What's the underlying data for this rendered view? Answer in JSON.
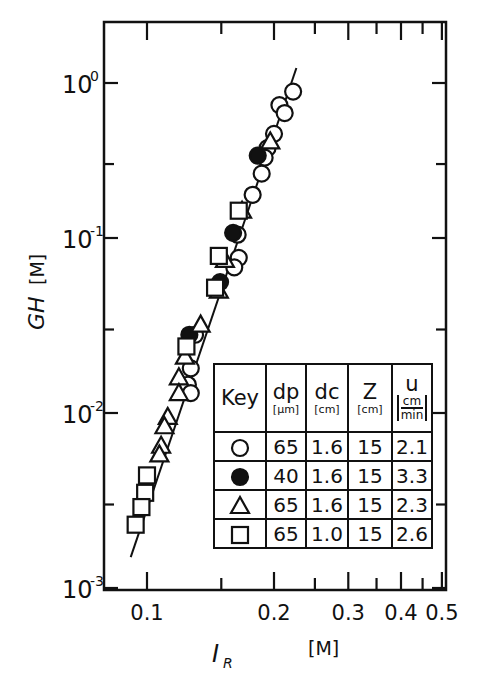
{
  "chart_data": {
    "type": "scatter",
    "title": "",
    "xlabel": "I_R",
    "xlabel_unit": "[M]",
    "ylabel": "GH",
    "ylabel_unit": "[M]",
    "xscale": "log",
    "yscale": "log",
    "xlim": [
      0.079,
      0.5
    ],
    "ylim": [
      0.001,
      1.6
    ],
    "grid": false,
    "x_ticks": [
      {
        "value": 0.1,
        "label": "0.1"
      },
      {
        "value": 0.15,
        "label": ""
      },
      {
        "value": 0.2,
        "label": "0.2"
      },
      {
        "value": 0.25,
        "label": ""
      },
      {
        "value": 0.3,
        "label": "0.3"
      },
      {
        "value": 0.35,
        "label": ""
      },
      {
        "value": 0.4,
        "label": "0.4"
      },
      {
        "value": 0.45,
        "label": ""
      },
      {
        "value": 0.5,
        "label": "0.5"
      }
    ],
    "y_ticks": [
      {
        "value": 1,
        "base": "10",
        "exp": "0"
      },
      {
        "value": 0.3,
        "base": "",
        "exp": ""
      },
      {
        "value": 0.1,
        "base": "10",
        "exp": "-1"
      },
      {
        "value": 0.03,
        "base": "",
        "exp": ""
      },
      {
        "value": 0.01,
        "base": "10",
        "exp": "-2"
      },
      {
        "value": 0.003,
        "base": "",
        "exp": ""
      },
      {
        "value": 0.001,
        "base": "10",
        "exp": "-3"
      }
    ],
    "fit_line": {
      "x": [
        0.0915,
        0.226
      ],
      "y": [
        0.0015,
        1.25
      ]
    },
    "series": [
      {
        "name": "open-circle",
        "marker": "circle",
        "filled": false,
        "dp_um": 65,
        "dc_cm": 1.6,
        "Z_cm": 15,
        "u_cm_min": 2.1,
        "points": [
          [
            0.222,
            0.88
          ],
          [
            0.206,
            0.72
          ],
          [
            0.212,
            0.64
          ],
          [
            0.2,
            0.47
          ],
          [
            0.193,
            0.38
          ],
          [
            0.19,
            0.33
          ],
          [
            0.187,
            0.26
          ],
          [
            0.178,
            0.19
          ],
          [
            0.164,
            0.105
          ],
          [
            0.165,
            0.077
          ],
          [
            0.161,
            0.068
          ],
          [
            0.13,
            0.028
          ],
          [
            0.127,
            0.018
          ],
          [
            0.125,
            0.0145
          ],
          [
            0.127,
            0.013
          ]
        ]
      },
      {
        "name": "filled-circle",
        "marker": "circle",
        "filled": true,
        "dp_um": 40,
        "dc_cm": 1.6,
        "Z_cm": 15,
        "u_cm_min": 3.3,
        "points": [
          [
            0.183,
            0.34
          ],
          [
            0.16,
            0.108
          ],
          [
            0.149,
            0.056
          ],
          [
            0.126,
            0.028
          ]
        ]
      },
      {
        "name": "triangle",
        "marker": "triangle",
        "filled": false,
        "dp_um": 65,
        "dc_cm": 1.6,
        "Z_cm": 15,
        "u_cm_min": 2.3,
        "points": [
          [
            0.196,
            0.42
          ],
          [
            0.168,
            0.15
          ],
          [
            0.153,
            0.075
          ],
          [
            0.148,
            0.05
          ],
          [
            0.134,
            0.032
          ],
          [
            0.123,
            0.021
          ],
          [
            0.119,
            0.016
          ],
          [
            0.119,
            0.013
          ],
          [
            0.112,
            0.0095
          ],
          [
            0.11,
            0.0084
          ],
          [
            0.108,
            0.0065
          ],
          [
            0.107,
            0.0058
          ]
        ]
      },
      {
        "name": "square",
        "marker": "square",
        "filled": false,
        "dp_um": 65,
        "dc_cm": 1.0,
        "Z_cm": 15,
        "u_cm_min": 2.6,
        "points": [
          [
            0.165,
            0.15
          ],
          [
            0.148,
            0.079
          ],
          [
            0.145,
            0.052
          ],
          [
            0.124,
            0.024
          ],
          [
            0.1,
            0.0044
          ],
          [
            0.099,
            0.0035
          ],
          [
            0.097,
            0.0029
          ],
          [
            0.094,
            0.0023
          ]
        ]
      }
    ]
  },
  "legend": {
    "headers": [
      {
        "main": "Key",
        "unit": ""
      },
      {
        "main": "dp",
        "unit": "[μm]"
      },
      {
        "main": "dc",
        "unit": "[cm]"
      },
      {
        "main": "Z",
        "unit": "[cm]"
      },
      {
        "main": "u",
        "unit_num": "cm",
        "unit_den": "min"
      }
    ],
    "rows": [
      {
        "key": "open-circle",
        "dp": "65",
        "dc": "1.6",
        "Z": "15",
        "u": "2.1"
      },
      {
        "key": "filled-circle",
        "dp": "40",
        "dc": "1.6",
        "Z": "15",
        "u": "3.3"
      },
      {
        "key": "triangle",
        "dp": "65",
        "dc": "1.6",
        "Z": "15",
        "u": "2.3"
      },
      {
        "key": "square",
        "dp": "65",
        "dc": "1.0",
        "Z": "15",
        "u": "2.6"
      }
    ]
  },
  "axes": {
    "xlabel": "I",
    "xlabel_sub": "R",
    "xunit": "[M]",
    "ylabel": "GH",
    "yunit": "[M]"
  }
}
